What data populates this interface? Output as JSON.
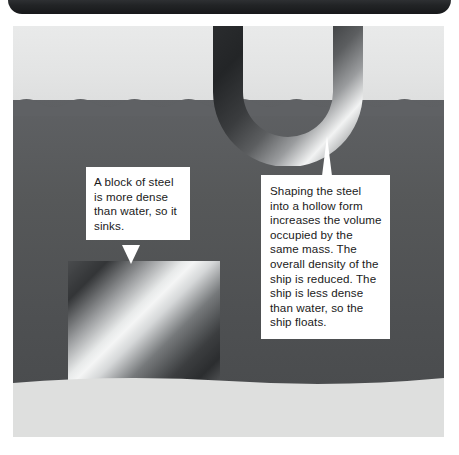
{
  "figure": {
    "alt_summary": "Cross-section diagram of water with a solid steel block resting on the seabed and a hollow U-shaped steel hull floating at the waterline, each labelled with a white callout box."
  },
  "header_bar": {
    "name": "top-rounded-bar"
  },
  "scene": {
    "sky_label": "sky",
    "water_label": "water",
    "seabed_label": "seabed"
  },
  "objects": {
    "steel_block": {
      "name": "solid-steel-block",
      "state": "sinks"
    },
    "hull": {
      "name": "hollow-steel-hull",
      "state": "floats"
    }
  },
  "callouts": [
    {
      "id": "steel-block-callout",
      "text": "A block of steel is more dense than water, so it sinks.",
      "tail": "down"
    },
    {
      "id": "ship-hull-callout",
      "text": "Shaping the steel into a hollow form increases the volume occupied by the same mass. The overall density of the ship is reduced. The ship is less dense than water, so the ship floats.",
      "tail": "up"
    }
  ],
  "colors": {
    "sky": "#e4e5e5",
    "water": "#535557",
    "seabed": "#dcdedd",
    "callout_background": "#ffffff",
    "callout_text": "#1a1a1a",
    "bar_dark": "#1f2123",
    "steel_light": "#f4f5f5",
    "steel_dark": "#2b2d2f"
  }
}
